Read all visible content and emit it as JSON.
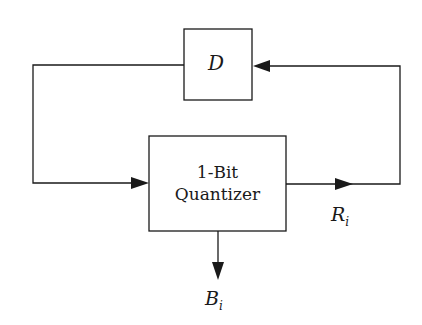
{
  "diagram": {
    "type": "block-diagram",
    "blocks": [
      {
        "id": "delay",
        "label": "D"
      },
      {
        "id": "quantizer",
        "label_line1": "1-Bit",
        "label_line2": "Quantizer"
      }
    ],
    "signals": [
      {
        "id": "residual",
        "label_main": "R",
        "label_sub": "i"
      },
      {
        "id": "bit",
        "label_main": "B",
        "label_sub": "i"
      }
    ],
    "connections": [
      {
        "from": "delay",
        "to": "quantizer"
      },
      {
        "from": "quantizer",
        "to": "residual"
      },
      {
        "from": "residual",
        "to": "delay"
      },
      {
        "from": "quantizer",
        "to": "bit"
      }
    ],
    "line_color": "#1a1a1a",
    "background": "#ffffff"
  }
}
